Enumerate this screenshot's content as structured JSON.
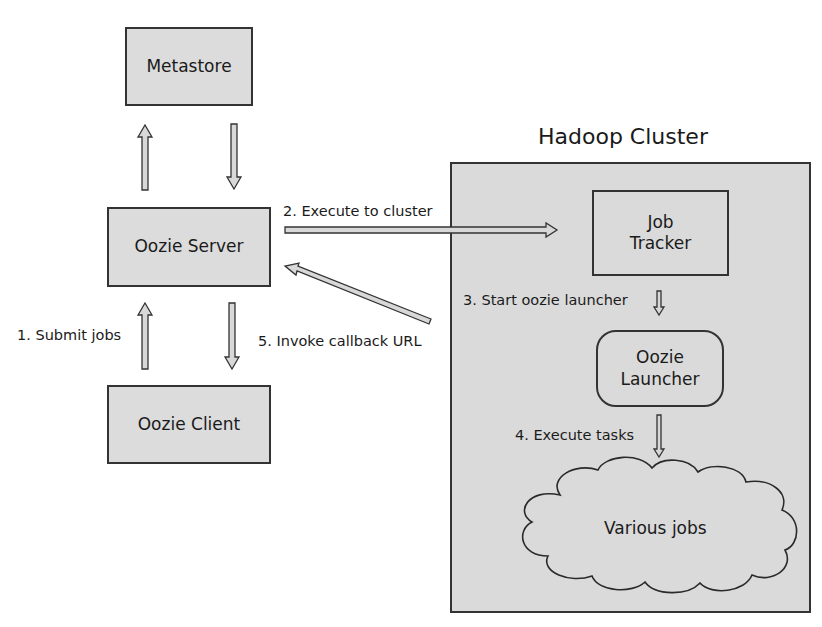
{
  "diagram": {
    "nodes": {
      "metastore": {
        "label": "Metastore"
      },
      "oozie_server": {
        "label": "Oozie Server"
      },
      "oozie_client": {
        "label": "Oozie Client"
      },
      "job_tracker": {
        "label_line1": "Job",
        "label_line2": "Tracker"
      },
      "oozie_launcher": {
        "label_line1": "Oozie",
        "label_line2": "Launcher"
      },
      "various_jobs": {
        "label": "Various jobs"
      }
    },
    "cluster": {
      "title": "Hadoop Cluster"
    },
    "edges": [
      {
        "id": "submit",
        "label": "1. Submit jobs",
        "from": "Oozie Client",
        "to": "Oozie Server"
      },
      {
        "id": "execute_cluster",
        "label": "2. Execute to cluster",
        "from": "Oozie Server",
        "to": "Job Tracker"
      },
      {
        "id": "start_launcher",
        "label": "3. Start oozie launcher",
        "from": "Job Tracker",
        "to": "Oozie Launcher"
      },
      {
        "id": "execute_tasks",
        "label": "4. Execute tasks",
        "from": "Oozie Launcher",
        "to": "Various jobs"
      },
      {
        "id": "callback",
        "label": "5. Invoke callback URL",
        "from": "Hadoop Cluster",
        "to": "Oozie Server"
      }
    ],
    "colors": {
      "box_fill": "#dcdcdc",
      "cluster_fill": "#dadada",
      "stroke": "#333333",
      "arrow_fill": "#d8d8d8"
    }
  }
}
